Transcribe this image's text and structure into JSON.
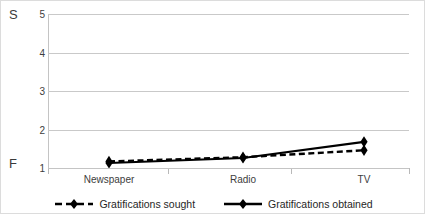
{
  "chart_data": {
    "type": "line",
    "title": "",
    "xlabel": "",
    "ylabel": "",
    "categories": [
      "Newspaper",
      "Radio",
      "TV"
    ],
    "series": [
      {
        "name": "Gratifications sought",
        "values": [
          1.17,
          1.28,
          1.46
        ],
        "style": "dashed",
        "marker": "diamond",
        "color": "#000000"
      },
      {
        "name": "Gratifications obtained",
        "values": [
          1.13,
          1.26,
          1.68
        ],
        "style": "solid",
        "marker": "diamond",
        "color": "#000000"
      }
    ],
    "ylim": [
      1,
      5
    ],
    "yticks": [
      1,
      2,
      3,
      4,
      5
    ],
    "ytick_labels": [
      "1",
      "2",
      "3",
      "4",
      "5"
    ],
    "grid": true,
    "legend_position": "bottom"
  },
  "annotations": {
    "top_axis_marker": "S",
    "bottom_axis_marker": "F"
  },
  "colors": {
    "gridline": "#c9c9c9",
    "axis": "#c4c4c4",
    "series": "#000000",
    "frame": "#dcdcdc",
    "text": "#3d3d3d"
  }
}
